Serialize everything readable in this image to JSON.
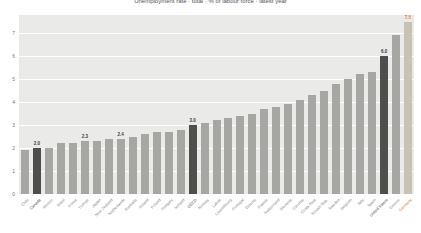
{
  "chart_data": {
    "type": "bar",
    "title": "Unemployment rate · total · % of labour force · latest year",
    "categories": [
      "Chile",
      "Canada",
      "Mexico",
      "Israel",
      "Korea",
      "Türkiye",
      "Japan",
      "New Zealand",
      "Netherlands",
      "Australia",
      "Ireland",
      "Poland",
      "Hungary",
      "Iceland",
      "OECD",
      "Norway",
      "Latvia",
      "Luxembourg",
      "Portugal",
      "Estonia",
      "France",
      "Switzerland",
      "Slovenia",
      "Czechia",
      "Costa Rica",
      "Slovak Rep.",
      "Sweden",
      "Belgium",
      "Italy",
      "Spain",
      "United States",
      "Greece",
      "Germany"
    ],
    "values": [
      1.9,
      2.0,
      2.0,
      2.2,
      2.2,
      2.3,
      2.3,
      2.4,
      2.4,
      2.5,
      2.6,
      2.7,
      2.7,
      2.8,
      3.0,
      3.1,
      3.2,
      3.3,
      3.4,
      3.5,
      3.7,
      3.8,
      3.9,
      4.1,
      4.3,
      4.5,
      4.8,
      5.0,
      5.2,
      5.3,
      6.0,
      6.9,
      7.5
    ],
    "value_labels": [
      "",
      "2.0",
      "",
      "",
      "",
      "2.3",
      "",
      "",
      "2.4",
      "",
      "",
      "",
      "",
      "",
      "3.0",
      "",
      "",
      "",
      "",
      "",
      "",
      "",
      "",
      "",
      "",
      "",
      "",
      "",
      "",
      "",
      "6.0",
      "",
      "7.5"
    ],
    "highlight_indices": [
      1,
      14,
      30
    ],
    "last_bar_special": true,
    "xlabel": "",
    "ylabel": "",
    "ylim": [
      0,
      7.8
    ],
    "yticks": [
      0,
      1,
      2,
      3,
      4,
      5,
      6,
      7
    ],
    "grid": true,
    "legend": "none",
    "colors": {
      "bar_default": "#a6a6a3",
      "bar_highlight": "#4e4e4c",
      "bar_last": "#c8c2b4",
      "value_label": "#3a3a3a",
      "value_label_last": "#e07b2a",
      "plot_bg": "#eaeae8",
      "gridline": "#ffffff",
      "axis_text": "#7a7a7a"
    },
    "layout": {
      "plot_left": 19,
      "plot_top": 15,
      "plot_width": 395,
      "plot_height": 179,
      "px_per_unit": 23,
      "bar_width": 8
    }
  }
}
